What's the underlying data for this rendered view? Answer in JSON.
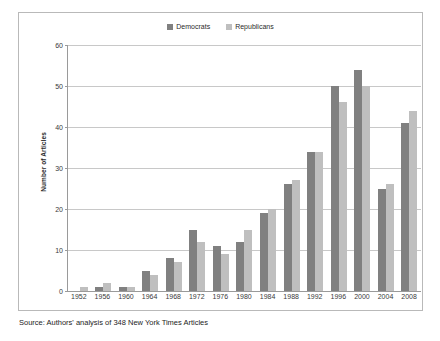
{
  "chart_data": {
    "type": "bar",
    "title": "",
    "xlabel": "",
    "ylabel": "Number of Articles",
    "ylim": [
      0,
      60
    ],
    "yticks": [
      0,
      10,
      20,
      30,
      40,
      50,
      60
    ],
    "grid": true,
    "legend_position": "top-center",
    "categories": [
      "1952",
      "1956",
      "1960",
      "1964",
      "1968",
      "1972",
      "1976",
      "1980",
      "1984",
      "1988",
      "1992",
      "1996",
      "2000",
      "2004",
      "2008"
    ],
    "series": [
      {
        "name": "Democrats",
        "color": "#808080",
        "values": [
          0,
          1,
          1,
          5,
          8,
          15,
          11,
          12,
          19,
          26,
          34,
          50,
          54,
          25,
          41
        ]
      },
      {
        "name": "Republicans",
        "color": "#bfbfbf",
        "values": [
          1,
          2,
          1,
          4,
          7,
          12,
          9,
          15,
          20,
          27,
          34,
          46,
          50,
          26,
          44
        ]
      }
    ],
    "source_note": "Source: Authors' analysis of 348 New York Times Articles"
  },
  "legend": {
    "items": [
      {
        "label": "Democrats",
        "swatch": "legend-swatch-democrats",
        "color": "#808080"
      },
      {
        "label": "Republicans",
        "swatch": "legend-swatch-republicans",
        "color": "#bfbfbf"
      }
    ]
  },
  "axes": {
    "y_title": "Number of Articles",
    "y_tick_labels": [
      "60",
      "50",
      "40",
      "30",
      "20",
      "10",
      "0"
    ],
    "x_tick_labels": [
      "1952",
      "1956",
      "1960",
      "1964",
      "1968",
      "1972",
      "1976",
      "1980",
      "1984",
      "1988",
      "1992",
      "1996",
      "2000",
      "2004",
      "2008"
    ]
  },
  "footer": {
    "source": "Source: Authors' analysis of 348 New York Times Articles"
  }
}
